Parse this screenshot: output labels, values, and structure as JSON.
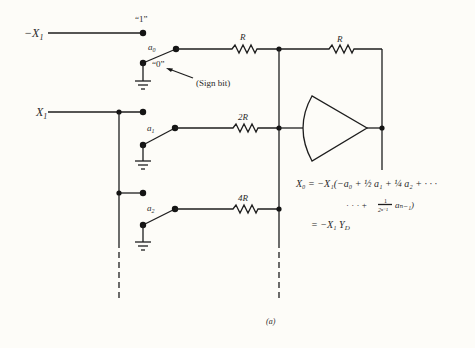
{
  "figure": {
    "caption": "(a)",
    "inputs": {
      "neg_input": "−X",
      "neg_input_sub": "1",
      "pos_input": "X",
      "pos_input_sub": "1"
    },
    "switch_labels": {
      "one_label": "“1”",
      "zero_label": "“0”",
      "sign_bit_note": "(Sign bit)",
      "a0": "a",
      "a0_sub": "0",
      "a1": "a",
      "a1_sub": "1",
      "a2": "a",
      "a2_sub": "2"
    },
    "resistors": {
      "r0": "R",
      "r1": "2R",
      "r2": "4R",
      "feedback": "R"
    },
    "equation": {
      "line1": "X₀ = −X₁(−a₀ + ½ a₁ + ¼ a₂ + · · ·",
      "line2_prefix": "· · · +",
      "line2_num": "1",
      "line2_den": "2ⁿ⁻¹",
      "line2_suffix": "aₙ₋₁)",
      "line3": "= −X₁ Y_D",
      "line3_main": "= −X₁ Y",
      "line3_sub": "D"
    }
  }
}
